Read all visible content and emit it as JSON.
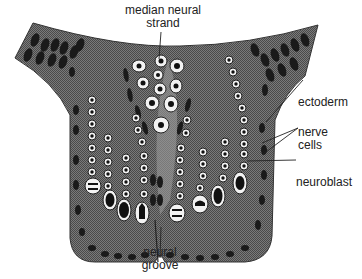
{
  "diagram": {
    "colors": {
      "tissue": "#6b6b6b",
      "ectoderm_cells": "#222222",
      "cell_ring": "#f2f2f2",
      "nucleus": "#111111",
      "leader_line": "#222222",
      "background": "#ffffff"
    },
    "labels": {
      "median_strand_line1": "median neural",
      "median_strand_line2": "strand",
      "ectoderm": "ectoderm",
      "nerve_cells_line1": "nerve",
      "nerve_cells_line2": "cells",
      "neuroblast": "neuroblast",
      "neural_groove_line1": "neural",
      "neural_groove_line2": "groove"
    }
  }
}
